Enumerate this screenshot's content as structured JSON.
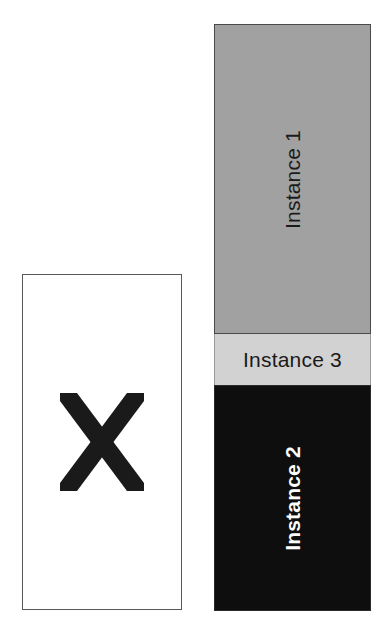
{
  "figure": {
    "background_color": "#ffffff",
    "width": 387,
    "height": 627
  },
  "left_panel": {
    "name": "empty-instance-box",
    "border_color": "#58585a",
    "fill_color": "#ffffff",
    "mark": {
      "glyph": "X",
      "icon_name": "x-mark-icon",
      "color": "#1a1a1a"
    }
  },
  "right_panel": {
    "name": "instance-stack",
    "blocks": [
      {
        "id": "instance-1",
        "label": "Instance 1",
        "fill_color": "#a1a1a1",
        "text_color": "#1a1a1a",
        "orientation": "vertical",
        "bold": false
      },
      {
        "id": "instance-3",
        "label": "Instance 3",
        "fill_color": "#d2d2d2",
        "text_color": "#1a1a1a",
        "orientation": "horizontal",
        "bold": false
      },
      {
        "id": "instance-2",
        "label": "Instance 2",
        "fill_color": "#0e0e0e",
        "text_color": "#fdfdfd",
        "orientation": "vertical",
        "bold": true
      }
    ]
  }
}
